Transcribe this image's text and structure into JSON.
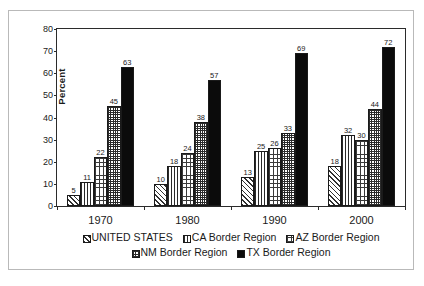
{
  "chart_data": {
    "type": "bar",
    "title": "",
    "xlabel": "",
    "ylabel": "Percent",
    "ylim": [
      0,
      80
    ],
    "yticks": [
      0,
      10,
      20,
      30,
      40,
      50,
      60,
      70,
      80
    ],
    "grid": false,
    "legend_position": "bottom",
    "categories": [
      "1970",
      "1980",
      "1990",
      "2000"
    ],
    "series": [
      {
        "name": "UNITED STATES",
        "pattern": "diagonal-hatch",
        "values": [
          5,
          10,
          13,
          18
        ]
      },
      {
        "name": "CA Border Region",
        "pattern": "vertical-lines",
        "values": [
          11,
          18,
          25,
          32
        ]
      },
      {
        "name": "AZ Border Region",
        "pattern": "coarse-grid",
        "values": [
          22,
          24,
          26,
          30
        ]
      },
      {
        "name": "NM Border Region",
        "pattern": "fine-grid",
        "values": [
          45,
          38,
          33,
          44
        ]
      },
      {
        "name": "TX Border Region",
        "pattern": "solid-black",
        "values": [
          63,
          57,
          69,
          72
        ]
      }
    ]
  },
  "colors": {
    "axis": "#2b2b2b",
    "text": "#1a1a1a",
    "frame": "#b9b9b9",
    "solid_series": "#0b0b0b",
    "background": "#ffffff"
  }
}
